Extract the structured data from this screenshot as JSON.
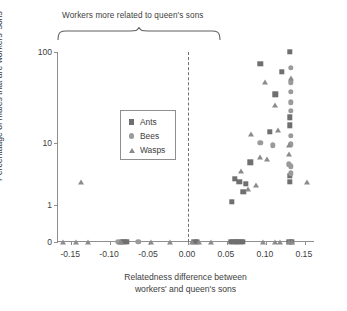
{
  "annotation": {
    "bracket_label": "Workers more related to queen's sons"
  },
  "legend": {
    "entries": [
      {
        "label": "Ants",
        "marker": "square-marker-icon"
      },
      {
        "label": "Bees",
        "marker": "circle-marker-icon"
      },
      {
        "label": "Wasps",
        "marker": "triangle-marker-icon"
      }
    ]
  },
  "axes": {
    "ytitle": "Percentaage of males that are workers' sons",
    "xtitle_line1": "Relatedness difference between",
    "xtitle_line2": "workers' and queen's sons",
    "yticks": [
      "100",
      "10",
      "1",
      "0"
    ],
    "xticks": [
      "-0.15",
      "-0.10",
      "-0.05",
      "0.00",
      "0.05",
      "0.10",
      "0.15"
    ]
  },
  "colors": {
    "ants": "#6f6f6f",
    "bees": "#9a9a9a",
    "wasps": "#8b8b8b",
    "axis": "#8e8e8e",
    "dashed_reference": "#707070",
    "text": "#3d3d3d"
  },
  "chart_data": {
    "type": "scatter",
    "title": "",
    "xlabel": "Relatedness difference between workers' and queen's sons",
    "ylabel": "Percentaage of males that are workers' sons",
    "xlim": [
      -0.175,
      0.155
    ],
    "ylim_log": [
      1,
      100
    ],
    "yscale": "log-with-zero-break",
    "ytick_values": [
      0,
      1,
      10,
      100
    ],
    "xtick_values": [
      -0.15,
      -0.1,
      -0.05,
      0.0,
      0.05,
      0.1,
      0.15
    ],
    "grid": false,
    "legend_position": "top-left-inside",
    "reference_lines": [
      {
        "type": "vertical",
        "x": 0.0,
        "style": "dashed"
      }
    ],
    "annotations": [
      {
        "text": "Workers more related to queen's sons",
        "span_x": [
          -0.175,
          0.0
        ],
        "type": "curly-brace-above"
      }
    ],
    "series": [
      {
        "name": "Ants",
        "marker": "square",
        "color": "#6f6f6f",
        "points": [
          [
            -0.093,
            0
          ],
          [
            -0.09,
            0
          ],
          [
            -0.087,
            0
          ],
          [
            0.0,
            0
          ],
          [
            0.003,
            0
          ],
          [
            0.047,
            0
          ],
          [
            0.05,
            0
          ],
          [
            0.053,
            0
          ],
          [
            0.056,
            0
          ],
          [
            0.059,
            0
          ],
          [
            0.062,
            0
          ],
          [
            0.122,
            0
          ],
          [
            0.125,
            0
          ],
          [
            0.048,
            1.1
          ],
          [
            0.063,
            1.5
          ],
          [
            0.052,
            2.2
          ],
          [
            0.058,
            2.0
          ],
          [
            0.066,
            1.9
          ],
          [
            0.072,
            3.6
          ],
          [
            0.097,
            9.0
          ],
          [
            0.104,
            28
          ],
          [
            0.112,
            55
          ],
          [
            0.123,
            100
          ],
          [
            0.123,
            14
          ],
          [
            0.123,
            11
          ],
          [
            0.123,
            2.4
          ],
          [
            0.123,
            2.0
          ],
          [
            0.085,
            70
          ]
        ]
      },
      {
        "name": "Bees",
        "marker": "circle",
        "color": "#9a9a9a",
        "points": [
          [
            -0.072,
            0
          ],
          [
            -0.098,
            0
          ],
          [
            0.085,
            6.5
          ],
          [
            0.101,
            6.0
          ],
          [
            0.124,
            62
          ],
          [
            0.124,
            40
          ],
          [
            0.124,
            30
          ],
          [
            0.124,
            22
          ],
          [
            0.124,
            17
          ],
          [
            0.124,
            8.0
          ],
          [
            0.124,
            6.2
          ],
          [
            0.124,
            3.2
          ],
          [
            0.124,
            2.6
          ],
          [
            0.121,
            3.4
          ]
        ]
      },
      {
        "name": "Wasps",
        "marker": "triangle",
        "color": "#8b8b8b",
        "points": [
          [
            -0.168,
            0
          ],
          [
            -0.152,
            0
          ],
          [
            -0.136,
            0
          ],
          [
            -0.096,
            0
          ],
          [
            -0.094,
            0
          ],
          [
            -0.055,
            0
          ],
          [
            -0.031,
            0
          ],
          [
            -0.003,
            0
          ],
          [
            0.006,
            0
          ],
          [
            0.021,
            0
          ],
          [
            0.088,
            0
          ],
          [
            0.104,
            0
          ],
          [
            0.11,
            0
          ],
          [
            0.121,
            0
          ],
          [
            0.126,
            0
          ],
          [
            0.145,
            2.0
          ],
          [
            0.069,
            1.6
          ],
          [
            0.079,
            1.8
          ],
          [
            0.06,
            2.8
          ],
          [
            0.084,
            4.3
          ],
          [
            0.093,
            4.0
          ],
          [
            0.073,
            8.5
          ],
          [
            0.108,
            9.5
          ],
          [
            0.122,
            6.0
          ],
          [
            0.122,
            4.6
          ],
          [
            0.104,
            20
          ],
          [
            0.091,
            40
          ],
          [
            0.124,
            46
          ],
          [
            -0.145,
            2.0
          ]
        ]
      }
    ]
  }
}
